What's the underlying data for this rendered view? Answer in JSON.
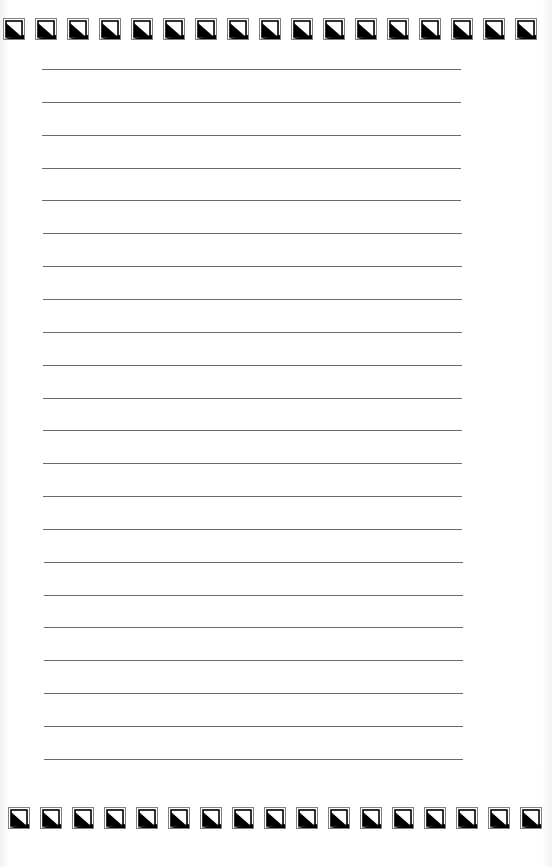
{
  "page": {
    "type": "lined-paper",
    "background": "#ffffff",
    "line_color": "#6a6a6a"
  },
  "border": {
    "icon": "triangle-square-tile-icon",
    "tile_color_dark": "#000000",
    "tile_color_frame": "#808080",
    "top_row": {
      "y": 18,
      "count": 17,
      "start_x": 3,
      "spacing": 32
    },
    "bottom_row": {
      "y": 807,
      "count": 17,
      "start_x": 8,
      "spacing": 32
    }
  },
  "ruled_lines": {
    "count": 22,
    "first_y": 69,
    "spacing": 32.85,
    "x_start": 42,
    "x_end": 461
  }
}
